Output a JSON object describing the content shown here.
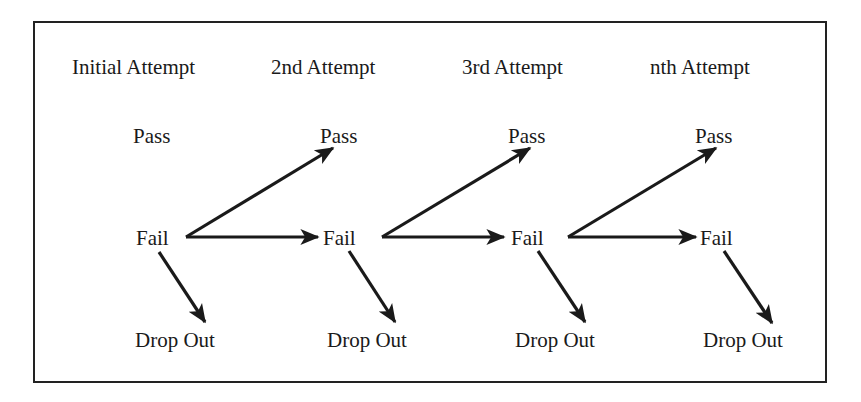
{
  "diagram": {
    "columns": [
      {
        "header": "Initial Attempt",
        "pass": "Pass",
        "fail": "Fail",
        "dropout": "Drop Out"
      },
      {
        "header": "2nd Attempt",
        "pass": "Pass",
        "fail": "Fail",
        "dropout": "Drop Out"
      },
      {
        "header": "3rd Attempt",
        "pass": "Pass",
        "fail": "Fail",
        "dropout": "Drop Out"
      },
      {
        "header": "nth Attempt",
        "pass": "Pass",
        "fail": "Fail",
        "dropout": "Drop Out"
      }
    ],
    "edges": [
      {
        "from": "Fail (Initial Attempt)",
        "to": "Pass (2nd Attempt)"
      },
      {
        "from": "Fail (Initial Attempt)",
        "to": "Fail (2nd Attempt)"
      },
      {
        "from": "Fail (Initial Attempt)",
        "to": "Drop Out (Initial Attempt)"
      },
      {
        "from": "Fail (2nd Attempt)",
        "to": "Pass (3rd Attempt)"
      },
      {
        "from": "Fail (2nd Attempt)",
        "to": "Fail (3rd Attempt)"
      },
      {
        "from": "Fail (2nd Attempt)",
        "to": "Drop Out (2nd Attempt)"
      },
      {
        "from": "Fail (3rd Attempt)",
        "to": "Pass (nth Attempt)"
      },
      {
        "from": "Fail (3rd Attempt)",
        "to": "Fail (nth Attempt)"
      },
      {
        "from": "Fail (3rd Attempt)",
        "to": "Drop Out (3rd Attempt)"
      },
      {
        "from": "Fail (nth Attempt)",
        "to": "Drop Out (nth Attempt)"
      }
    ],
    "colors": {
      "line": "#1a1a1a",
      "background": "#ffffff"
    }
  }
}
